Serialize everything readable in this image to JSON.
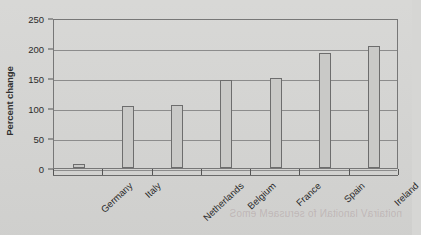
{
  "chart_data": {
    "type": "bar",
    "title": "",
    "xlabel": "",
    "ylabel": "Percent change",
    "categories": [
      "Germany",
      "Italy",
      "Netherlands",
      "Belgium",
      "France",
      "Spain",
      "Ireland"
    ],
    "values": [
      7,
      104,
      105,
      147,
      150,
      192,
      203
    ],
    "ylim": [
      0,
      250
    ],
    "yticks": [
      0,
      50,
      100,
      150,
      200,
      250
    ],
    "ytick_labels": [
      "0",
      "50",
      "100",
      "150",
      "200",
      "250"
    ],
    "grid": "horizontal",
    "legend": "none",
    "series": [
      {
        "name": "Percent change",
        "values": [
          7,
          104,
          105,
          147,
          150,
          192,
          203
        ]
      }
    ],
    "colors": {
      "bar_fill": "#c9c9c7",
      "bar_edge": "#6d6d6d",
      "grid": "#8c8c8c",
      "frame": "#777777",
      "background": "#d6d6d4",
      "text": "#2b2b2b"
    }
  },
  "bleed_text": "noitairaV lanoitaN fo serusaeM emoS"
}
